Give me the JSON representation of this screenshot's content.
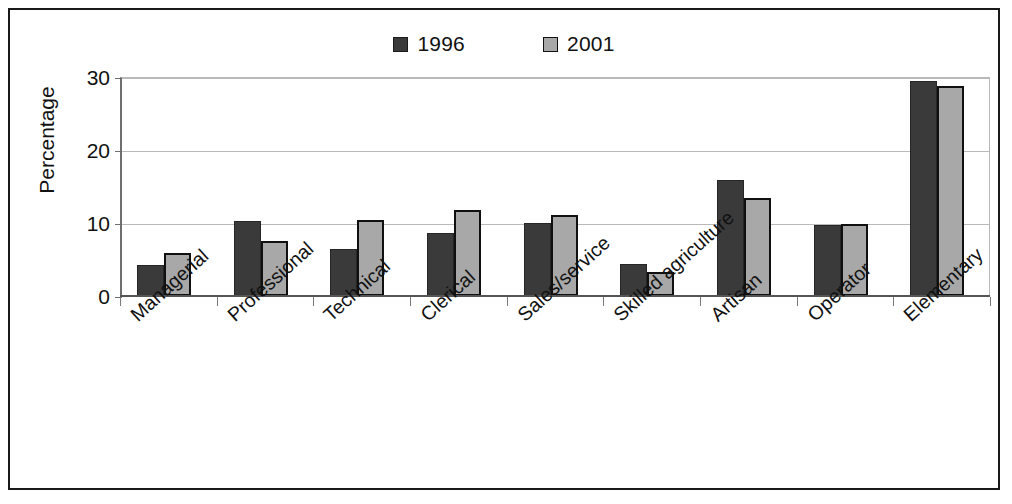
{
  "chart_data": {
    "type": "bar",
    "title": "",
    "subtitle": "",
    "xlabel": "",
    "ylabel": "Percentage",
    "ylim": [
      0,
      30
    ],
    "yticks": [
      0,
      10,
      20,
      30
    ],
    "ytick_labels": [
      "0",
      "10",
      "20",
      "30"
    ],
    "grid": true,
    "legend_position": "top-center",
    "categories": [
      "Managerial",
      "Professional",
      "Technical",
      "Clerical",
      "Sales/service",
      "Skilled agriculture",
      "Artisan",
      "Operator",
      "Elementary"
    ],
    "series": [
      {
        "name": "1996",
        "color": "#3a3a3a",
        "values": [
          4.2,
          10.3,
          6.5,
          8.6,
          10.0,
          4.4,
          15.9,
          9.7,
          29.4
        ]
      },
      {
        "name": "2001",
        "color": "#a8a8a8",
        "values": [
          5.9,
          7.6,
          10.4,
          11.8,
          11.1,
          3.3,
          13.4,
          9.8,
          28.8
        ]
      }
    ]
  },
  "legend": {
    "entries": [
      {
        "label": "1996",
        "swatch": "dark-square-swatch"
      },
      {
        "label": "2001",
        "swatch": "light-square-swatch"
      }
    ]
  },
  "axes": {
    "y_title": "Percentage"
  },
  "colors": {
    "series_1996": "#3a3a3a",
    "series_2001": "#a8a8a8",
    "frame": "#1a1a1a",
    "gridline": "#b9b9b9",
    "axis": "#6e6e6e",
    "background": "#ffffff"
  }
}
